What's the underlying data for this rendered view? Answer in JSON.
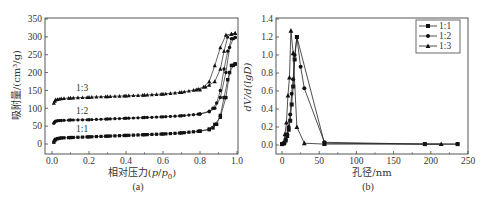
{
  "chart_data": [
    {
      "type": "line",
      "panel": "(a)",
      "title": "",
      "xlabel": "相对压力(p/p0)",
      "ylabel": "吸附量/(cm³/g)",
      "xlim": [
        0.0,
        1.0
      ],
      "ylim": [
        -25,
        350
      ],
      "xticks": [
        "0.0",
        "0.2",
        "0.4",
        "0.6",
        "0.8",
        "1.0"
      ],
      "yticks": [
        "0",
        "50",
        "100",
        "150",
        "200",
        "250",
        "300",
        "350"
      ],
      "grid": false,
      "legend": "inline annotations",
      "annotations": [
        {
          "text": "1:3",
          "x": 0.13,
          "y": 148
        },
        {
          "text": "1:2",
          "x": 0.13,
          "y": 83
        },
        {
          "text": "1:1",
          "x": 0.13,
          "y": 35
        }
      ],
      "series": [
        {
          "name": "1:1",
          "marker": "square",
          "adsorption": {
            "x": [
              0.01,
              0.015,
              0.02,
              0.03,
              0.05,
              0.1,
              0.2,
              0.3,
              0.4,
              0.5,
              0.6,
              0.7,
              0.8,
              0.85,
              0.88,
              0.91,
              0.94,
              0.96,
              0.98,
              0.99
            ],
            "y": [
              5,
              10,
              13,
              15,
              17,
              18,
              20,
              22,
              24,
              26,
              28,
              31,
              36,
              42,
              55,
              75,
              130,
              200,
              220,
              224
            ]
          },
          "desorption": {
            "x": [
              0.99,
              0.97,
              0.95,
              0.93,
              0.91,
              0.89,
              0.87,
              0.85,
              0.8
            ],
            "y": [
              224,
              220,
              180,
              130,
              80,
              55,
              45,
              40,
              36
            ]
          }
        },
        {
          "name": "1:2",
          "marker": "circle",
          "adsorption": {
            "x": [
              0.01,
              0.015,
              0.02,
              0.03,
              0.05,
              0.1,
              0.2,
              0.3,
              0.4,
              0.5,
              0.6,
              0.7,
              0.8,
              0.85,
              0.88,
              0.91,
              0.94,
              0.96,
              0.98,
              0.99
            ],
            "y": [
              58,
              62,
              64,
              65,
              66,
              67,
              68,
              70,
              72,
              74,
              76,
              79,
              84,
              90,
              100,
              130,
              200,
              270,
              295,
              298
            ]
          },
          "desorption": {
            "x": [
              0.99,
              0.97,
              0.95,
              0.93,
              0.91,
              0.89,
              0.87,
              0.85,
              0.8
            ],
            "y": [
              298,
              295,
              260,
              210,
              150,
              115,
              100,
              92,
              84
            ]
          }
        },
        {
          "name": "1:3",
          "marker": "triangle",
          "adsorption": {
            "x": [
              0.01,
              0.015,
              0.02,
              0.03,
              0.05,
              0.1,
              0.2,
              0.3,
              0.4,
              0.5,
              0.6,
              0.7,
              0.78,
              0.82,
              0.85,
              0.88,
              0.91,
              0.94,
              0.97,
              0.99
            ],
            "y": [
              115,
              120,
              124,
              125,
              127,
              129,
              131,
              133,
              135,
              137,
              140,
              145,
              152,
              160,
              175,
              220,
              270,
              305,
              308,
              310
            ]
          },
          "desorption": {
            "x": [
              0.99,
              0.97,
              0.95,
              0.93,
              0.91,
              0.88,
              0.85,
              0.83,
              0.8
            ],
            "y": [
              310,
              308,
              300,
              260,
              210,
              175,
              165,
              160,
              152
            ]
          }
        }
      ]
    },
    {
      "type": "line",
      "panel": "(b)",
      "title": "",
      "xlabel": "孔径/nm",
      "ylabel": "dV/d(lgD)",
      "xlim": [
        -5,
        250
      ],
      "ylim": [
        -0.1,
        1.4
      ],
      "xticks": [
        "0",
        "50",
        "100",
        "150",
        "200",
        "250"
      ],
      "yticks": [
        "0.0",
        "0.2",
        "0.4",
        "0.6",
        "0.8",
        "1.0",
        "1.2",
        "1.4"
      ],
      "grid": false,
      "legend_position": "upper right",
      "legend": [
        "1:1",
        "1:2",
        "1:3"
      ],
      "series": [
        {
          "name": "1:1",
          "marker": "square",
          "x": [
            0,
            3,
            5,
            7,
            9,
            11,
            13,
            15,
            17,
            20,
            57,
            192,
            236
          ],
          "y": [
            0.01,
            0.02,
            0.05,
            0.1,
            0.17,
            0.27,
            0.45,
            0.65,
            0.95,
            1.2,
            0.02,
            0.01,
            0.01
          ]
        },
        {
          "name": "1:2",
          "marker": "circle",
          "x": [
            0,
            3,
            5,
            7,
            9,
            11,
            13,
            15,
            17,
            20,
            25,
            30,
            57,
            192,
            236
          ],
          "y": [
            0.01,
            0.02,
            0.06,
            0.12,
            0.2,
            0.34,
            0.57,
            0.73,
            1.0,
            1.2,
            0.87,
            0.63,
            0.03,
            0.01,
            0.01
          ]
        },
        {
          "name": "1:3",
          "marker": "triangle",
          "x": [
            0,
            2,
            4,
            6,
            8,
            10,
            12,
            15,
            20,
            30,
            57,
            214
          ],
          "y": [
            0.01,
            0.02,
            0.12,
            0.25,
            0.55,
            0.75,
            1.27,
            1.02,
            0.2,
            0.02,
            0.01,
            0.01
          ]
        }
      ]
    }
  ],
  "panels": {
    "a": {
      "caption": "(a)",
      "ylabel": "吸附量/(cm³/g)",
      "xlabel_prefix": "相对压力(",
      "xlabel_p": "p",
      "xlabel_slash": "/",
      "xlabel_p0": "p",
      "xlabel_sub": "0",
      "xlabel_suffix": ")",
      "xticks": [
        "0.0",
        "0.2",
        "0.4",
        "0.6",
        "0.8",
        "1.0"
      ],
      "yticks": [
        "350",
        "300",
        "250",
        "200",
        "150",
        "100",
        "50",
        "0"
      ],
      "annotations": [
        "1:3",
        "1:2",
        "1:1"
      ]
    },
    "b": {
      "caption": "(b)",
      "ylabel": "dV/d(lgD)",
      "xlabel": "孔径/nm",
      "xticks": [
        "0",
        "50",
        "100",
        "150",
        "200",
        "250"
      ],
      "yticks": [
        "1.4",
        "1.2",
        "1.0",
        "0.8",
        "0.6",
        "0.4",
        "0.2",
        "0.0"
      ],
      "legend": [
        "1:1",
        "1:2",
        "1:3"
      ]
    }
  }
}
